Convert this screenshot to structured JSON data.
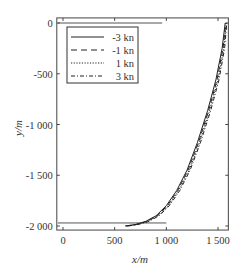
{
  "chart_data": {
    "type": "line",
    "title": "",
    "xlabel": "x/m",
    "ylabel": "y/m",
    "xlim": [
      -60,
      1600
    ],
    "ylim": [
      -2040,
      50
    ],
    "grid": false,
    "legend_position": "upper left",
    "x_ticks": [
      0,
      500,
      1000,
      1500
    ],
    "x_tick_labels": [
      "0",
      "500",
      "1 000",
      "1 500"
    ],
    "y_ticks": [
      0,
      -500,
      -1000,
      -1500,
      -2000
    ],
    "y_tick_labels": [
      "0",
      "-500",
      "-1 000",
      "-1 500",
      "-2 000"
    ],
    "reference_lines": [
      {
        "name": "start-line",
        "y": 0,
        "x_from": -60,
        "x_to": 960
      },
      {
        "name": "target-line",
        "y": -1970,
        "x_from": -60,
        "x_to": 1000
      }
    ],
    "series": [
      {
        "name": "-3 kn",
        "style": "solid",
        "x": [
          600,
          700,
          800,
          900,
          1000,
          1100,
          1200,
          1300,
          1400,
          1480,
          1540,
          1570
        ],
        "y": [
          -2000,
          -1985,
          -1955,
          -1900,
          -1800,
          -1650,
          -1450,
          -1180,
          -860,
          -560,
          -250,
          0
        ]
      },
      {
        "name": "-1 kn",
        "style": "dashed",
        "x": [
          610,
          710,
          810,
          910,
          1010,
          1110,
          1210,
          1310,
          1410,
          1490,
          1548,
          1575
        ],
        "y": [
          -2000,
          -1985,
          -1955,
          -1900,
          -1800,
          -1650,
          -1450,
          -1180,
          -860,
          -560,
          -250,
          0
        ]
      },
      {
        "name": "1 kn",
        "style": "dotted",
        "x": [
          620,
          720,
          820,
          920,
          1020,
          1120,
          1220,
          1320,
          1420,
          1500,
          1556,
          1580
        ],
        "y": [
          -2000,
          -1985,
          -1955,
          -1900,
          -1800,
          -1650,
          -1450,
          -1180,
          -860,
          -560,
          -250,
          0
        ]
      },
      {
        "name": "3 kn",
        "style": "dash-dot",
        "x": [
          630,
          730,
          830,
          930,
          1030,
          1130,
          1230,
          1330,
          1430,
          1510,
          1564,
          1585
        ],
        "y": [
          -2000,
          -1985,
          -1955,
          -1900,
          -1800,
          -1650,
          -1450,
          -1180,
          -860,
          -560,
          -250,
          0
        ]
      }
    ]
  }
}
